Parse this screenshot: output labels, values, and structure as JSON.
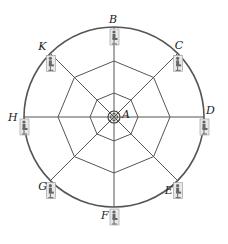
{
  "diagram": {
    "center_label": "A",
    "center": [
      114,
      117
    ],
    "outer_radius": 90,
    "ring_radii": [
      6,
      24,
      56
    ],
    "stroke_color": "#555555",
    "points": [
      {
        "label": "B",
        "angle": -90
      },
      {
        "label": "C",
        "angle": -45
      },
      {
        "label": "D",
        "angle": 0
      },
      {
        "label": "E",
        "angle": 45
      },
      {
        "label": "F",
        "angle": 90
      },
      {
        "label": "G",
        "angle": 135
      },
      {
        "label": "H",
        "angle": 180
      },
      {
        "label": "K",
        "angle": -135
      }
    ],
    "point_icon": "seated-person-icon"
  }
}
